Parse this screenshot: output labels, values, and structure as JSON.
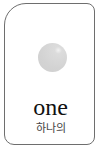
{
  "card": {
    "word": "one",
    "translation": "하나의",
    "image": "gray-circle-icon",
    "colors": {
      "border": "#6e6e6e",
      "circle": "#d3d3d3",
      "text": "#111111"
    }
  }
}
